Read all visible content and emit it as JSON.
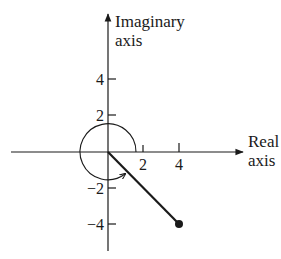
{
  "diagram": {
    "type": "complex-plane",
    "colors": {
      "ink": "#1a1a1a",
      "background": "#ffffff"
    },
    "axes": {
      "x_label_line1": "Real",
      "x_label_line2": "axis",
      "y_label_line1": "Imaginary",
      "y_label_line2": "axis"
    },
    "x_ticks": [
      {
        "value": 2,
        "label": "2"
      },
      {
        "value": 4,
        "label": "4"
      }
    ],
    "y_ticks": [
      {
        "value": 4,
        "label": "4"
      },
      {
        "value": 2,
        "label": "2"
      },
      {
        "value": -2,
        "label": "−2"
      },
      {
        "value": -4,
        "label": "−4"
      }
    ],
    "circle": {
      "center": [
        0,
        0
      ],
      "radius": 1.55,
      "direction": "counterclockwise",
      "note": "arc with arrowhead"
    },
    "vector": {
      "from": [
        0,
        0
      ],
      "to": [
        4,
        -4
      ],
      "endpoint_marker": "filled-dot"
    }
  }
}
